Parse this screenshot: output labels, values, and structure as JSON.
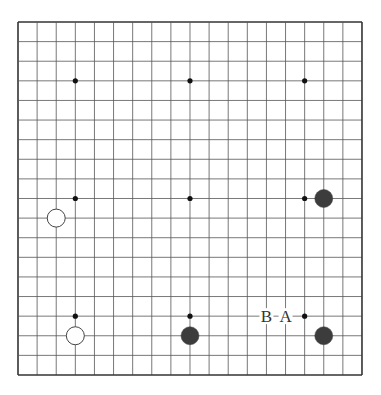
{
  "board": {
    "size": 19,
    "origin_x": 18,
    "origin_y": 22,
    "spacing_x": 19.11,
    "spacing_y": 19.61,
    "line_color": "#555555",
    "border_color": "#333333",
    "background": "#ffffff"
  },
  "hoshi": [
    {
      "col": 3,
      "row": 3
    },
    {
      "col": 9,
      "row": 3
    },
    {
      "col": 15,
      "row": 3
    },
    {
      "col": 3,
      "row": 9
    },
    {
      "col": 9,
      "row": 9
    },
    {
      "col": 15,
      "row": 9
    },
    {
      "col": 3,
      "row": 15
    },
    {
      "col": 9,
      "row": 15
    },
    {
      "col": 15,
      "row": 15
    }
  ],
  "stones": [
    {
      "color": "black",
      "col": 16,
      "row": 9
    },
    {
      "color": "white",
      "col": 2,
      "row": 10
    },
    {
      "color": "white",
      "col": 3,
      "row": 16
    },
    {
      "color": "black",
      "col": 9,
      "row": 16
    },
    {
      "color": "black",
      "col": 16,
      "row": 16
    }
  ],
  "labels": [
    {
      "text": "B",
      "col": 13,
      "row": 15
    },
    {
      "text": "A",
      "col": 14,
      "row": 15
    }
  ],
  "colors": {
    "black_stone": "#3c3c3c",
    "white_stone_fill": "#ffffff",
    "white_stone_stroke": "#444444"
  }
}
